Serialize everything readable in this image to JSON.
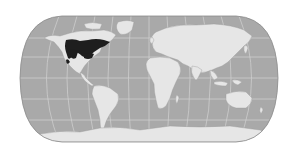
{
  "map": {
    "projection": "pseudocylindrical-world",
    "colors": {
      "background": "#ffffff",
      "ocean": "#a9a9a9",
      "land": "#e6e6e6",
      "graticule": "#d2d2d2",
      "outline": "#8a8a8a",
      "highlight_range": "#1e1e1e",
      "coast": "#9a9a9a"
    },
    "highlighted_region": "North America (temperate/boreal range)",
    "graticule": {
      "meridians": 12,
      "parallels": 5
    }
  }
}
